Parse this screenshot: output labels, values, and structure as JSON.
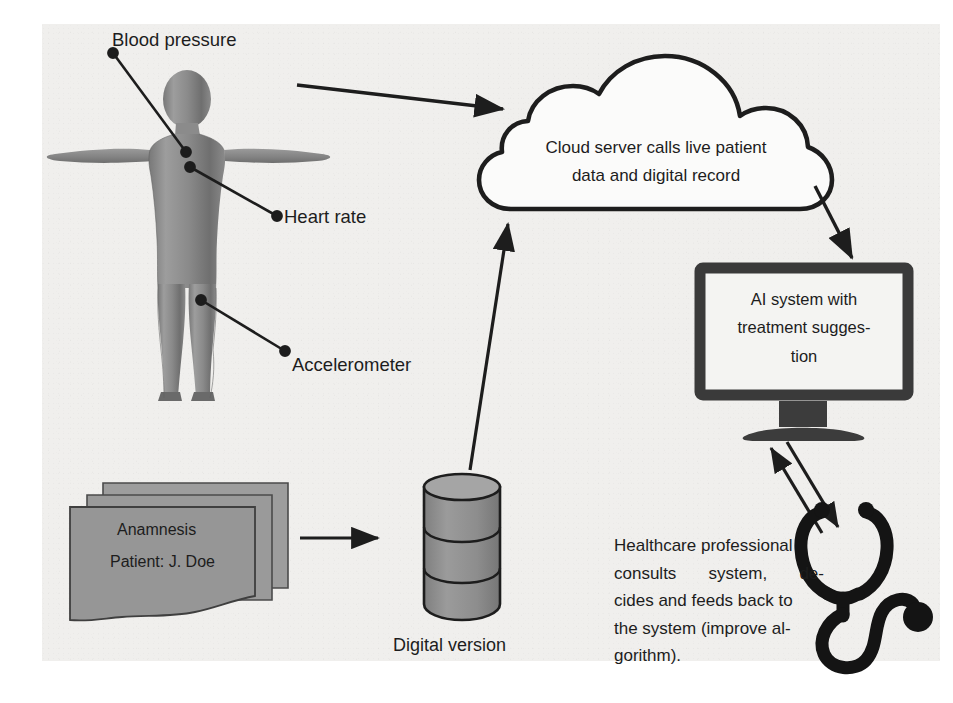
{
  "diagram": {
    "colors": {
      "ink": "#1d1d1d",
      "page": "#f0efed",
      "body_fill": "#8d8d8d",
      "document_fill": "#9a9a9a",
      "database_fill": "#949494",
      "monitor_frame": "#3a3a3a",
      "screen_fill": "#f4f4f2"
    },
    "sensor_labels": [
      {
        "id": "blood-pressure",
        "text": "Blood pressure"
      },
      {
        "id": "heart-rate",
        "text": "Heart rate"
      },
      {
        "id": "accelerometer",
        "text": "Accelerometer"
      }
    ],
    "cloud": {
      "line1": "Cloud server calls live patient",
      "line2": "data and digital record"
    },
    "monitor": {
      "line1": "AI system with",
      "line2": "treatment sugges-",
      "line3": "tion"
    },
    "documents": {
      "title": "Anamnesis",
      "patient": "Patient: J. Doe",
      "stack_count": 3
    },
    "database": {
      "caption": "Digital version",
      "bands": 3
    },
    "healthcare": {
      "line1": "Healthcare professional",
      "line2a": "consults",
      "line2b": "system,",
      "line2c": "de-",
      "line3": "cides and feeds back to",
      "line4": "the system (improve al-",
      "line5": "gorithm)."
    },
    "connectors": [
      {
        "id": "body-to-cloud",
        "from": "human-body",
        "to": "cloud",
        "direction": "one-way"
      },
      {
        "id": "cloud-to-monitor",
        "from": "cloud",
        "to": "ai-monitor",
        "direction": "one-way"
      },
      {
        "id": "documents-to-database",
        "from": "document-stack",
        "to": "database",
        "direction": "one-way"
      },
      {
        "id": "database-to-cloud",
        "from": "database",
        "to": "cloud",
        "direction": "one-way"
      },
      {
        "id": "monitor-clinician",
        "from": "ai-monitor",
        "to": "stethoscope",
        "direction": "two-way"
      }
    ]
  }
}
